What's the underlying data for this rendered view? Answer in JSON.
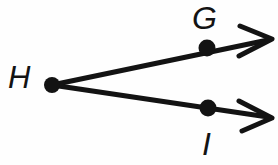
{
  "figure": {
    "kind": "geometry-angle-diagram",
    "background_color": "#fefefe",
    "stroke_color": "#131313",
    "canvas": {
      "width": 278,
      "height": 165
    }
  },
  "points": [
    {
      "id": "H",
      "label": "H",
      "role": "vertex",
      "x": 52,
      "y": 85,
      "dot_radius": 8,
      "label_x": 8,
      "label_y": 62
    },
    {
      "id": "G",
      "label": "G",
      "role": "ray-point-upper",
      "x": 207,
      "y": 48,
      "dot_radius": 8,
      "label_x": 192,
      "label_y": 2
    },
    {
      "id": "I",
      "label": "I",
      "role": "ray-point-lower",
      "x": 208,
      "y": 108,
      "dot_radius": 8,
      "label_x": 202,
      "label_y": 128
    }
  ],
  "rays": [
    {
      "id": "ray-HG",
      "name": "ray-h-to-g",
      "from": "H",
      "through": "G",
      "start_x": 52,
      "start_y": 85,
      "end_x": 268,
      "end_y": 40,
      "arrowhead": "open-v",
      "stroke_width": 5
    },
    {
      "id": "ray-HI",
      "name": "ray-h-to-i",
      "from": "H",
      "through": "I",
      "start_x": 52,
      "start_y": 85,
      "end_x": 268,
      "end_y": 117,
      "arrowhead": "open-v",
      "stroke_width": 5
    }
  ],
  "arrowheads": [
    {
      "id": "arrow-upper",
      "tip_x": 272,
      "tip_y": 39,
      "upper_barb_x": 240,
      "upper_barb_y": 26,
      "lower_barb_x": 239,
      "lower_barb_y": 56
    },
    {
      "id": "arrow-lower",
      "tip_x": 272,
      "tip_y": 118,
      "upper_barb_x": 239,
      "upper_barb_y": 101,
      "lower_barb_x": 242,
      "lower_barb_y": 131
    }
  ]
}
